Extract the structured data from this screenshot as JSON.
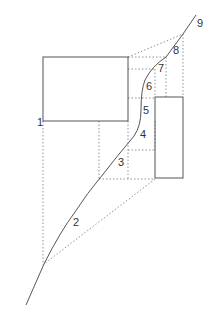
{
  "diagram": {
    "type": "curve-with-projection-boxes",
    "colors": {
      "line": "#555555",
      "dotted": "#777777",
      "background": "#ffffff"
    },
    "labels": [
      "1",
      "2",
      "3",
      "4",
      "5",
      "6",
      "7",
      "8",
      "9"
    ],
    "rectangles": [
      {
        "name": "left-box",
        "x": 43,
        "y": 57,
        "w": 85,
        "h": 64
      },
      {
        "name": "right-box",
        "x": 155,
        "y": 97,
        "w": 28,
        "h": 81
      }
    ]
  }
}
